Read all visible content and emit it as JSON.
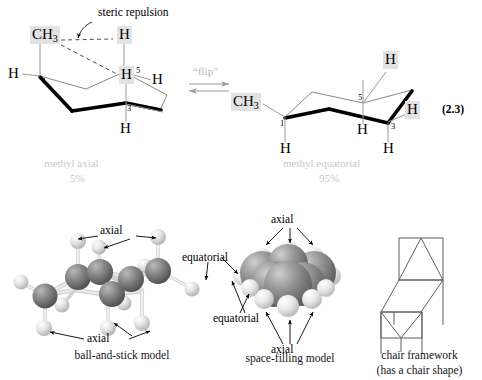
{
  "figure": {
    "equation_number": "(2.3)",
    "steric_label": "steric repulsion",
    "flip_label": "“flip”"
  },
  "left_structure": {
    "name": "methyl axial chair conformer",
    "caption_line1": "methyl axial",
    "caption_line2": "5%",
    "labels": {
      "methyl": "CH",
      "methyl_sub": "3",
      "h_top_right": "H",
      "h_middle": "H",
      "h_left": "H",
      "h_right": "H",
      "h_bottom": "H"
    },
    "carbon_numbers": {
      "c1": "1",
      "c3": "3",
      "c5": "5"
    }
  },
  "right_structure": {
    "name": "methyl equatorial chair conformer",
    "caption_line1": "methyl equatorial",
    "caption_line2": "95%",
    "labels": {
      "methyl": "CH",
      "methyl_sub": "3",
      "h_top": "H",
      "h_right": "H",
      "h_left_bottom": "H",
      "h_mid_bottom": "H",
      "h_bottom": "H"
    },
    "carbon_numbers": {
      "c1": "1",
      "c3": "3",
      "c5": "5"
    }
  },
  "models": [
    {
      "id": "ball-and-stick",
      "caption": "ball-and-stick model",
      "annotations": [
        "axial",
        "equatorial",
        "axial"
      ]
    },
    {
      "id": "space-filling",
      "caption": "space-filling model",
      "annotations": [
        "axial",
        "equatorial",
        "axial"
      ]
    },
    {
      "id": "chair-framework",
      "caption_line1": "chair framework",
      "caption_line2": "(has a chair shape)"
    }
  ],
  "colors": {
    "background": "#ffffff",
    "line": "#5a5a5a",
    "bold_bond": "#000000",
    "highlight": "#e2e2e2",
    "ghost_text": "#c9c9c9",
    "carbon_dark": "#6e6e6e",
    "hydrogen_light": "#dcdcdc"
  }
}
